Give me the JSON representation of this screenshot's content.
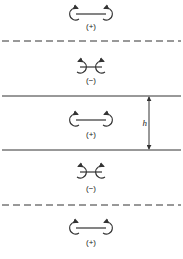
{
  "diagram": {
    "type": "vortex-pair image system between walls",
    "stroke_color": "#333333",
    "background": "#ffffff",
    "pairs": [
      {
        "sign": "(+)",
        "label": "(+)",
        "cy": 14,
        "label_y": 29,
        "orientation": "outward",
        "half_width": 15
      },
      {
        "sign": "(-)",
        "label": "(−)",
        "cy": 67,
        "label_y": 83,
        "orientation": "inward",
        "half_width": 11
      },
      {
        "sign": "(+)",
        "label": "(+)",
        "cy": 120,
        "label_y": 137,
        "orientation": "outward",
        "half_width": 15
      },
      {
        "sign": "(-)",
        "label": "(−)",
        "cy": 172,
        "label_y": 191,
        "orientation": "inward",
        "half_width": 11
      },
      {
        "sign": "(+)",
        "label": "(+)",
        "cy": 228,
        "label_y": 245,
        "orientation": "outward",
        "half_width": 15
      }
    ],
    "lines": [
      {
        "kind": "dashed",
        "y": 41
      },
      {
        "kind": "solid",
        "y": 96
      },
      {
        "kind": "solid",
        "y": 150
      },
      {
        "kind": "dashed",
        "y": 205
      }
    ],
    "dimension": {
      "label": "h",
      "x": 149,
      "y_top": 96,
      "y_bottom": 150
    }
  }
}
